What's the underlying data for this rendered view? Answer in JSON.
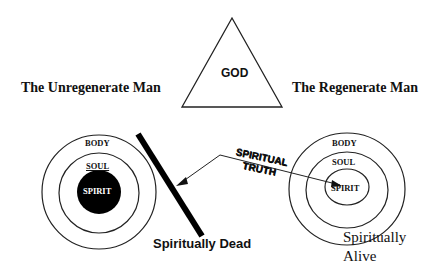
{
  "diagram": {
    "center": {
      "label": "GOD",
      "shape": "triangle"
    },
    "left": {
      "title": "The Unregenerate Man",
      "rings": {
        "outer": "BODY",
        "middle": "SOUL",
        "inner": "SPIRIT"
      },
      "inner_filled": true,
      "state": "Spiritually Dead",
      "barrier": "thick diagonal line"
    },
    "right": {
      "title": "The Regenerate Man",
      "rings": {
        "outer": "BODY",
        "middle": "SOUL",
        "inner": "SPIRIT"
      },
      "inner_filled": false,
      "state_line1": "Spiritually",
      "state_line2": "Alive"
    },
    "arrow": {
      "line1": "SPIRITUAL",
      "line2": "TRUTH"
    }
  }
}
